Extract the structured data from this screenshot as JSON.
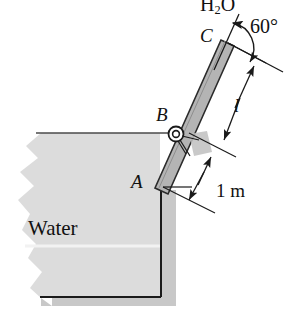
{
  "figure": {
    "labels": {
      "point_a": "A",
      "point_b": "B",
      "point_c": "C",
      "angle": "60°",
      "length_l": "l",
      "dim_one_meter": "1 m",
      "water": "Water",
      "fluid_head_prefix": "H",
      "fluid_head_sub": "2",
      "fluid_head_suffix": "O"
    },
    "colors": {
      "water_fill": "#dcdcdc",
      "water_shadow": "#c8c8c8",
      "gate_fill": "#b4b4b4",
      "gate_outline": "#2b2b2b",
      "line": "#1a1a1a",
      "text": "#111111",
      "block_fill": "#c0c0c0",
      "background": "#ffffff"
    },
    "geometry": {
      "angle_degrees": 60,
      "gate_point_a": [
        162,
        186
      ],
      "gate_point_b": [
        176,
        134
      ],
      "gate_point_c": [
        228,
        43
      ],
      "water_surface_y": 133,
      "container_bottom_y": 296,
      "dimension_l_label_position": [
        237,
        105
      ],
      "dimension_one_meter_label_position": [
        225,
        186
      ]
    }
  }
}
